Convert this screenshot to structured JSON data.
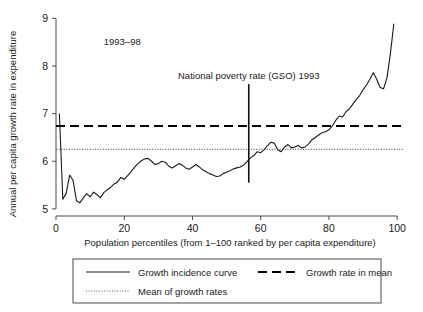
{
  "chart_data": {
    "type": "line",
    "title": "",
    "period_label": "1993–98",
    "xlabel": "Population percentiles (from 1–100 ranked by per capita expenditure)",
    "ylabel": "Annual per capita growth rate in expenditure",
    "xlim": [
      0,
      102
    ],
    "ylim": [
      4.85,
      9.05
    ],
    "xticks": [
      0,
      20,
      40,
      60,
      80,
      100
    ],
    "xtick_labels": [
      "0",
      "20",
      "40",
      "60",
      "80",
      "100"
    ],
    "yticks": [
      5,
      6,
      7,
      8,
      9
    ],
    "ytick_labels": [
      "5",
      "6",
      "7",
      "8",
      "9"
    ],
    "grid": false,
    "legend_position": "below-axes",
    "annotations": [
      {
        "name": "period-annotation",
        "text": "1993–98",
        "x": 14,
        "y": 8.45
      },
      {
        "name": "poverty-rate-annotation",
        "text": "National poverty rate (GSO) 1993",
        "x": 56.5,
        "y": 7.72
      }
    ],
    "reference_lines": [
      {
        "name": "growth-rate-in-mean",
        "label": "Growth rate in mean",
        "orientation": "horizontal",
        "value": 6.74,
        "style": "dashed"
      },
      {
        "name": "mean-of-growth-rates",
        "label": "Mean of growth rates",
        "orientation": "horizontal",
        "value": 6.25,
        "style": "dotted"
      },
      {
        "name": "national-poverty-rate-1993",
        "label": "National poverty rate (GSO) 1993",
        "orientation": "vertical",
        "value": 56.5,
        "style": "solid",
        "y_range": [
          5.55,
          7.62
        ]
      }
    ],
    "series": [
      {
        "name": "Growth incidence curve",
        "style": "solid",
        "x": [
          1,
          2,
          3,
          4,
          5,
          6,
          7,
          8,
          9,
          10,
          11,
          12,
          13,
          14,
          15,
          16,
          17,
          18,
          19,
          20,
          21,
          22,
          23,
          24,
          25,
          26,
          27,
          28,
          29,
          30,
          31,
          32,
          33,
          34,
          35,
          36,
          37,
          38,
          39,
          40,
          41,
          42,
          43,
          44,
          45,
          46,
          47,
          48,
          49,
          50,
          51,
          52,
          53,
          54,
          55,
          56,
          57,
          58,
          59,
          60,
          61,
          62,
          63,
          64,
          65,
          66,
          67,
          68,
          69,
          70,
          71,
          72,
          73,
          74,
          75,
          76,
          77,
          78,
          79,
          80,
          81,
          82,
          83,
          84,
          85,
          86,
          87,
          88,
          89,
          90,
          91,
          92,
          93,
          94,
          95,
          96,
          97,
          98,
          99
        ],
        "values": [
          6.99,
          5.2,
          5.33,
          5.71,
          5.6,
          5.17,
          5.13,
          5.23,
          5.32,
          5.25,
          5.35,
          5.3,
          5.23,
          5.34,
          5.4,
          5.45,
          5.52,
          5.56,
          5.66,
          5.62,
          5.7,
          5.78,
          5.87,
          5.95,
          6.01,
          6.05,
          6.06,
          6.0,
          5.93,
          5.95,
          6.0,
          5.98,
          5.9,
          5.86,
          5.9,
          5.95,
          5.92,
          5.86,
          5.83,
          5.88,
          5.93,
          5.88,
          5.82,
          5.78,
          5.74,
          5.71,
          5.68,
          5.69,
          5.74,
          5.77,
          5.8,
          5.84,
          5.86,
          5.88,
          5.92,
          5.99,
          6.07,
          6.12,
          6.2,
          6.18,
          6.24,
          6.33,
          6.4,
          6.38,
          6.24,
          6.2,
          6.3,
          6.35,
          6.28,
          6.3,
          6.33,
          6.28,
          6.3,
          6.36,
          6.45,
          6.5,
          6.55,
          6.6,
          6.62,
          6.66,
          6.74,
          6.86,
          6.95,
          6.93,
          7.04,
          7.1,
          7.2,
          7.3,
          7.38,
          7.5,
          7.6,
          7.72,
          7.86,
          7.72,
          7.55,
          7.52,
          7.75,
          8.25,
          8.88
        ]
      }
    ],
    "legend": [
      {
        "name": "legend-growth-incidence-curve",
        "label": "Growth incidence curve",
        "style": "solid"
      },
      {
        "name": "legend-growth-rate-in-mean",
        "label": "Growth rate in mean",
        "style": "dashed"
      },
      {
        "name": "legend-mean-of-growth-rates",
        "label": "Mean of growth rates",
        "style": "dotted"
      }
    ],
    "colors": {
      "curve": "#1a1a1a",
      "mean_growth": "#000000",
      "growth_mean": "#555555",
      "axis": "#4a4a4a",
      "background": "#ffffff"
    }
  }
}
